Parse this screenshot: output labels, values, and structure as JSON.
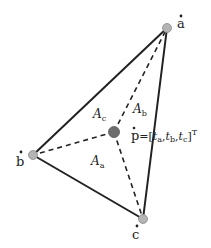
{
  "diagram": {
    "vertices": [
      {
        "id": "a",
        "label": "a",
        "x": 167,
        "y": 28
      },
      {
        "id": "b",
        "label": "b",
        "x": 33,
        "y": 155
      },
      {
        "id": "c",
        "label": "c",
        "x": 143,
        "y": 219
      }
    ],
    "interior_point": {
      "id": "p",
      "label": "p",
      "x": 114,
      "y": 132
    },
    "areas": [
      {
        "id": "A_a",
        "base": "A",
        "sub": "a",
        "opposite_of": "a"
      },
      {
        "id": "A_b",
        "base": "A",
        "sub": "b",
        "opposite_of": "b"
      },
      {
        "id": "A_c",
        "base": "A",
        "sub": "c",
        "opposite_of": "c"
      }
    ],
    "formula": {
      "lhs": "p",
      "eq": "=",
      "open": "[",
      "t_base": "t",
      "t_subs": [
        "a",
        "b",
        "c"
      ],
      "sep": ",",
      "close": "]",
      "sup": "T"
    },
    "colors": {
      "edge": "#222222",
      "vertex_fill": "#b4b4b4",
      "point_fill": "#6e6e6e",
      "background": "#ffffff"
    }
  }
}
